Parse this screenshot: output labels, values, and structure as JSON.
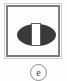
{
  "canvas": {
    "width": 67,
    "height": 81,
    "background_color": "#fdfdfd"
  },
  "icon": {
    "name": "contrast-icon",
    "meaning": "contrast",
    "frame": {
      "outer_border_color": "#cfcfcf",
      "inner_border_color": "#7d7d7d",
      "fill_color": "#fdfdfd"
    },
    "ellipse": {
      "fill_color": "#3a3a3a"
    },
    "bar": {
      "fill_color": "#fdfdfd",
      "stroke_color": "#5a5a5a"
    }
  },
  "mark": {
    "name": "circled-e-mark",
    "letter": "e",
    "stroke_color": "#8a8a8a",
    "text_color": "#4a4a4a"
  }
}
